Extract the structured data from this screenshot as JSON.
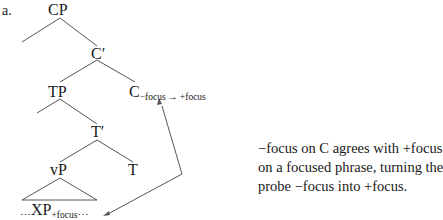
{
  "example_label": "a.",
  "nodes": {
    "cp": "CP",
    "c_bar": "C′",
    "tp": "TP",
    "c": "C",
    "c_sub": "−focus → +focus",
    "t_bar": "T′",
    "vp": "vP",
    "t": "T",
    "xp_pre": "…",
    "xp": "XP",
    "xp_sub": "+focus",
    "xp_post": "…"
  },
  "caption": {
    "lines": [
      "−focus on C agrees with +focus",
      "on a focused phrase, turning the",
      "probe −focus into +focus."
    ]
  },
  "colors": {
    "text": "#1a1a1a",
    "lines": "#555555",
    "background": "#ffffff"
  }
}
